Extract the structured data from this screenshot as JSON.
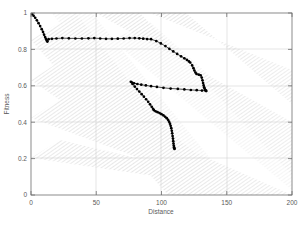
{
  "chart_data": {
    "type": "line",
    "title": "",
    "xlabel": "Distance",
    "ylabel": "Fitness",
    "xlim": [
      0,
      200
    ],
    "ylim": [
      0,
      1
    ],
    "xticks": [
      0,
      50,
      100,
      150,
      200
    ],
    "yticks": [
      0,
      0.2,
      0.4,
      0.6,
      0.8,
      1
    ],
    "xtick_labels": [
      "0",
      "50",
      "100",
      "150",
      "200"
    ],
    "ytick_labels": [
      "0",
      "0.2",
      "0.4",
      "0.6",
      "0.8",
      "1"
    ],
    "grid": true,
    "legend": "none",
    "background_bands": {
      "description": "diagonal gray hatched bands running from upper-left to lower-right",
      "color": "#b9b9b9"
    },
    "series": [
      {
        "name": "upper-front",
        "color": "#000000",
        "marker": "dot",
        "points": [
          [
            0.0,
            1.0
          ],
          [
            1.0,
            0.993
          ],
          [
            2.0,
            0.985
          ],
          [
            3.2,
            0.974
          ],
          [
            4.5,
            0.96
          ],
          [
            5.8,
            0.944
          ],
          [
            7.0,
            0.928
          ],
          [
            8.2,
            0.911
          ],
          [
            9.2,
            0.896
          ],
          [
            10.0,
            0.881
          ],
          [
            10.8,
            0.868
          ],
          [
            11.4,
            0.858
          ],
          [
            11.9,
            0.851
          ],
          [
            12.3,
            0.846
          ],
          [
            12.6,
            0.843
          ],
          [
            13.5,
            0.856
          ],
          [
            16.0,
            0.858
          ],
          [
            19.5,
            0.86
          ],
          [
            24.0,
            0.862
          ],
          [
            29.0,
            0.861
          ],
          [
            34.0,
            0.86
          ],
          [
            39.0,
            0.86
          ],
          [
            44.0,
            0.861
          ],
          [
            48.5,
            0.862
          ],
          [
            53.0,
            0.86
          ],
          [
            57.5,
            0.858
          ],
          [
            62.0,
            0.858
          ],
          [
            66.5,
            0.859
          ],
          [
            71.0,
            0.86
          ],
          [
            75.5,
            0.862
          ],
          [
            79.5,
            0.862
          ],
          [
            83.0,
            0.861
          ],
          [
            86.0,
            0.859
          ],
          [
            89.0,
            0.857
          ],
          [
            92.0,
            0.856
          ],
          [
            96.0,
            0.846
          ],
          [
            99.5,
            0.833
          ],
          [
            103.0,
            0.818
          ],
          [
            106.0,
            0.803
          ],
          [
            109.0,
            0.789
          ],
          [
            112.0,
            0.775
          ],
          [
            115.0,
            0.762
          ],
          [
            117.5,
            0.751
          ],
          [
            119.5,
            0.742
          ],
          [
            121.0,
            0.734
          ],
          [
            122.0,
            0.728
          ],
          [
            123.5,
            0.712
          ],
          [
            124.5,
            0.697
          ],
          [
            125.2,
            0.684
          ],
          [
            126.0,
            0.673
          ],
          [
            126.8,
            0.665
          ],
          [
            128.5,
            0.661
          ],
          [
            130.0,
            0.658
          ],
          [
            130.8,
            0.645
          ],
          [
            131.4,
            0.63
          ],
          [
            131.9,
            0.615
          ],
          [
            132.3,
            0.602
          ],
          [
            132.7,
            0.592
          ],
          [
            133.0,
            0.585
          ],
          [
            133.4,
            0.578
          ],
          [
            133.8,
            0.574
          ],
          [
            134.2,
            0.572
          ]
        ]
      },
      {
        "name": "lower-front",
        "color": "#000000",
        "marker": "dot",
        "points": [
          [
            134.2,
            0.572
          ],
          [
            131.0,
            0.574
          ],
          [
            127.0,
            0.576
          ],
          [
            122.5,
            0.577
          ],
          [
            117.5,
            0.58
          ],
          [
            112.5,
            0.583
          ],
          [
            107.0,
            0.585
          ],
          [
            101.5,
            0.589
          ],
          [
            96.5,
            0.594
          ],
          [
            92.0,
            0.598
          ],
          [
            88.0,
            0.602
          ],
          [
            84.5,
            0.606
          ],
          [
            81.5,
            0.61
          ],
          [
            79.0,
            0.614
          ],
          [
            77.5,
            0.618
          ],
          [
            76.5,
            0.622
          ],
          [
            77.8,
            0.61
          ],
          [
            79.5,
            0.596
          ],
          [
            81.2,
            0.582
          ],
          [
            83.0,
            0.568
          ],
          [
            84.8,
            0.554
          ],
          [
            86.5,
            0.54
          ],
          [
            88.2,
            0.526
          ],
          [
            89.8,
            0.512
          ],
          [
            91.2,
            0.498
          ],
          [
            92.5,
            0.485
          ],
          [
            93.5,
            0.474
          ],
          [
            94.2,
            0.466
          ],
          [
            95.5,
            0.46
          ],
          [
            97.0,
            0.455
          ],
          [
            98.5,
            0.45
          ],
          [
            100.0,
            0.444
          ],
          [
            101.5,
            0.437
          ],
          [
            102.8,
            0.43
          ],
          [
            104.0,
            0.422
          ],
          [
            105.0,
            0.413
          ],
          [
            105.8,
            0.403
          ],
          [
            106.5,
            0.392
          ],
          [
            107.0,
            0.38
          ],
          [
            107.5,
            0.367
          ],
          [
            107.9,
            0.353
          ],
          [
            108.2,
            0.339
          ],
          [
            108.5,
            0.324
          ],
          [
            108.8,
            0.31
          ],
          [
            109.0,
            0.296
          ],
          [
            109.2,
            0.283
          ],
          [
            109.4,
            0.272
          ],
          [
            109.6,
            0.263
          ],
          [
            109.8,
            0.257
          ],
          [
            110.0,
            0.253
          ]
        ]
      }
    ]
  }
}
